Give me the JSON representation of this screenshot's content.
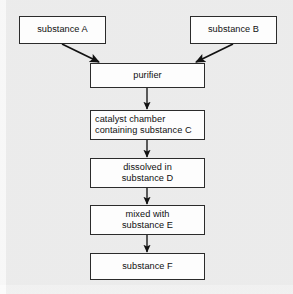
{
  "diagram": {
    "background_color": "#f1f1f1",
    "box_fill_color": "#fdfdfd",
    "box_border_color": "#2b2b2b",
    "edge_color": "#111111",
    "nodes": [
      {
        "id": "substance_a",
        "label": "substance A",
        "x": 19,
        "y": 16,
        "w": 87,
        "h": 28,
        "align": "center"
      },
      {
        "id": "substance_b",
        "label": "substance B",
        "x": 190,
        "y": 16,
        "w": 87,
        "h": 28,
        "align": "center"
      },
      {
        "id": "purifier",
        "label": "purifier",
        "x": 90,
        "y": 63,
        "w": 115,
        "h": 25,
        "align": "center"
      },
      {
        "id": "catalyst",
        "label": "catalyst chamber\ncontaining substance C",
        "x": 90,
        "y": 110,
        "w": 115,
        "h": 30,
        "align": "left"
      },
      {
        "id": "dissolved",
        "label": "dissolved in\nsubstance D",
        "x": 90,
        "y": 158,
        "w": 115,
        "h": 30,
        "align": "center"
      },
      {
        "id": "mixed",
        "label": "mixed with\nsubstance E",
        "x": 90,
        "y": 205,
        "w": 115,
        "h": 30,
        "align": "center"
      },
      {
        "id": "substance_f",
        "label": "substance F",
        "x": 90,
        "y": 253,
        "w": 115,
        "h": 27,
        "align": "center"
      }
    ],
    "edges": [
      {
        "id": "a-to-purifier",
        "from": "substance_a",
        "to": "purifier",
        "kind": "diagonal",
        "x1": 62,
        "y1": 44,
        "x2": 99,
        "y2": 62
      },
      {
        "id": "b-to-purifier",
        "from": "substance_b",
        "to": "purifier",
        "kind": "diagonal",
        "x1": 233,
        "y1": 44,
        "x2": 196,
        "y2": 62
      },
      {
        "id": "purifier-to-catalyst",
        "from": "purifier",
        "to": "catalyst",
        "kind": "vertical",
        "x1": 147,
        "y1": 88,
        "x2": 147,
        "y2": 109
      },
      {
        "id": "catalyst-to-dissolved",
        "from": "catalyst",
        "to": "dissolved",
        "kind": "vertical",
        "x1": 147,
        "y1": 140,
        "x2": 147,
        "y2": 157
      },
      {
        "id": "dissolved-to-mixed",
        "from": "dissolved",
        "to": "mixed",
        "kind": "vertical",
        "x1": 147,
        "y1": 188,
        "x2": 147,
        "y2": 204
      },
      {
        "id": "mixed-to-substance-f",
        "from": "mixed",
        "to": "substance_f",
        "kind": "vertical",
        "x1": 147,
        "y1": 235,
        "x2": 147,
        "y2": 252
      }
    ]
  }
}
